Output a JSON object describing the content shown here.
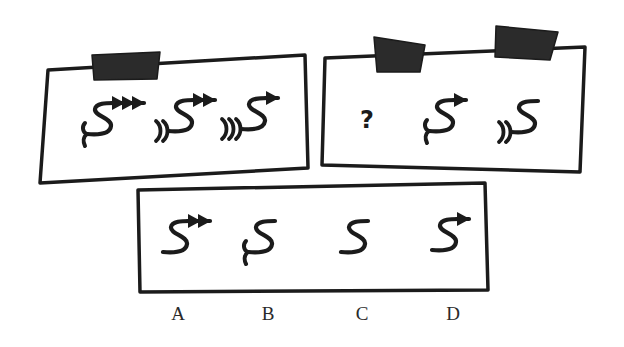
{
  "colors": {
    "ink": "#1b1b1b",
    "background": "#ffffff",
    "tab": "#2b2b2b"
  },
  "panels": [
    {
      "id": "left-panel",
      "role": "example sequence",
      "outline": [
        [
          48,
          70
        ],
        [
          305,
          55
        ],
        [
          308,
          168
        ],
        [
          40,
          183
        ]
      ],
      "tabs": [
        {
          "points": [
            [
              92,
              55
            ],
            [
              160,
              52
            ],
            [
              157,
              79
            ],
            [
              94,
              80
            ]
          ]
        }
      ],
      "items": [
        {
          "type": "glyph",
          "cx": 104,
          "cy": 120,
          "heads": 3,
          "tails": 1,
          "tail_style": "fork"
        },
        {
          "type": "glyph",
          "cx": 185,
          "cy": 117,
          "heads": 2,
          "tails": 2,
          "tail_style": "arcs"
        },
        {
          "type": "glyph",
          "cx": 258,
          "cy": 115,
          "heads": 1,
          "tails": 3,
          "tail_style": "arcs"
        }
      ]
    },
    {
      "id": "right-panel",
      "role": "question sequence",
      "outline": [
        [
          325,
          58
        ],
        [
          585,
          47
        ],
        [
          580,
          172
        ],
        [
          322,
          165
        ]
      ],
      "tabs": [
        {
          "points": [
            [
              374,
              37
            ],
            [
              425,
              45
            ],
            [
              420,
              72
            ],
            [
              377,
              72
            ]
          ]
        },
        {
          "points": [
            [
              496,
              26
            ],
            [
              558,
              32
            ],
            [
              550,
              60
            ],
            [
              495,
              57
            ]
          ]
        }
      ],
      "items": [
        {
          "type": "text",
          "x": 367,
          "y": 120,
          "text": "?"
        },
        {
          "type": "glyph",
          "cx": 446,
          "cy": 117,
          "heads": 1,
          "tails": 1,
          "tail_style": "fork"
        },
        {
          "type": "glyph",
          "cx": 528,
          "cy": 118,
          "heads": 0,
          "tails": 2,
          "tail_style": "arcs"
        }
      ]
    },
    {
      "id": "options-panel",
      "role": "answer options",
      "outline": [
        [
          138,
          190
        ],
        [
          485,
          183
        ],
        [
          488,
          290
        ],
        [
          140,
          292
        ]
      ],
      "tabs": [],
      "items": [
        {
          "type": "glyph",
          "cx": 180,
          "cy": 238,
          "heads": 2,
          "tails": 0,
          "tail_style": "none"
        },
        {
          "type": "glyph",
          "cx": 265,
          "cy": 238,
          "heads": 0,
          "tails": 1,
          "tail_style": "fork"
        },
        {
          "type": "glyph",
          "cx": 358,
          "cy": 238,
          "heads": 0,
          "tails": 0,
          "tail_style": "none"
        },
        {
          "type": "glyph",
          "cx": 449,
          "cy": 236,
          "heads": 1,
          "tails": 0,
          "tail_style": "none"
        }
      ]
    }
  ],
  "options": [
    {
      "label": "A",
      "x": 178,
      "y": 303
    },
    {
      "label": "B",
      "x": 268,
      "y": 303
    },
    {
      "label": "C",
      "x": 362,
      "y": 303
    },
    {
      "label": "D",
      "x": 453,
      "y": 303
    }
  ]
}
